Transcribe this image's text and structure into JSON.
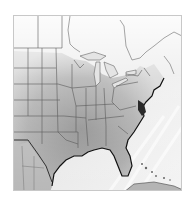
{
  "map": {
    "region": "Eastern United States",
    "style": "grayscale relief shading",
    "colors": {
      "frame": "#c8c8c8",
      "ocean": "#f0f0f0",
      "land_light": "#dcdcdc",
      "land_mid": "#a8a8a8",
      "land_dark": "#7c7c7c",
      "borders": "#555555",
      "coast": "#111111"
    }
  }
}
